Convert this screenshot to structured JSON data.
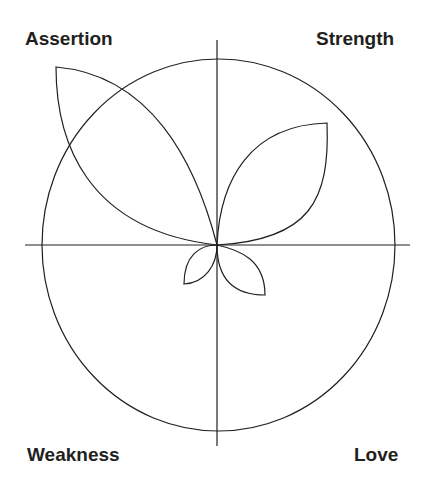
{
  "diagram": {
    "quadrant_labels": {
      "top_left": "Assertion",
      "top_right": "Strength",
      "bottom_left": "Weakness",
      "bottom_right": "Love"
    },
    "stroke_color": "#231f20",
    "background_color": "#ffffff"
  }
}
